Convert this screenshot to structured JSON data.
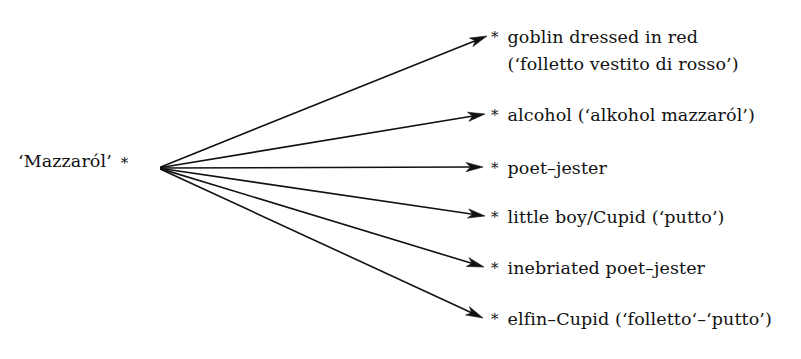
{
  "diagram": {
    "type": "radial-fan-mapping",
    "background_color": "#ffffff",
    "ink_color": "#111111",
    "source": {
      "label": "‘Mazzaról’",
      "marker": "*",
      "x": 158,
      "y": 168
    },
    "targets": [
      {
        "marker": "*",
        "lines": [
          "goblin dressed in red",
          "(‘folletto vestito di rosso’)"
        ],
        "arrow_tip_x": 487,
        "arrow_tip_y": 36,
        "text_x": 491,
        "text_top": 24
      },
      {
        "marker": "*",
        "lines": [
          "alcohol (‘alkohol mazzaról’)"
        ],
        "arrow_tip_x": 485,
        "arrow_tip_y": 114,
        "text_x": 491,
        "text_top": 102
      },
      {
        "marker": "*",
        "lines": [
          "poet–jester"
        ],
        "arrow_tip_x": 483,
        "arrow_tip_y": 167,
        "text_x": 491,
        "text_top": 155
      },
      {
        "marker": "*",
        "lines": [
          "little boy/Cupid (‘putto’)"
        ],
        "arrow_tip_x": 485,
        "arrow_tip_y": 216,
        "text_x": 491,
        "text_top": 204
      },
      {
        "marker": "*",
        "lines": [
          "inebriated poet–jester"
        ],
        "arrow_tip_x": 484,
        "arrow_tip_y": 267,
        "text_x": 491,
        "text_top": 255
      },
      {
        "marker": "*",
        "lines": [
          "elfin–Cupid (‘folletto‘–‘putto’)"
        ],
        "arrow_tip_x": 483,
        "arrow_tip_y": 318,
        "text_x": 491,
        "text_top": 306
      }
    ]
  }
}
